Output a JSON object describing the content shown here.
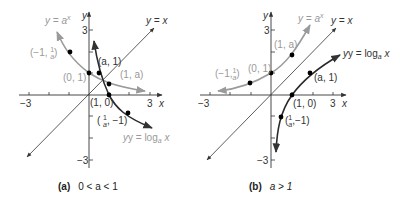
{
  "panels": [
    {
      "id": "a",
      "caption_letter": "(a)",
      "caption_condition": "0 < a < 1",
      "x_axis_label": "x",
      "y_axis_label": "y",
      "tick_labels": {
        "x_min": "−3",
        "x_max": "3",
        "y_max": "3",
        "y_min": "−3"
      },
      "curves": {
        "exp_label": "y = a",
        "exp_sup": "x",
        "identity_label": "y = x",
        "log_label": "y = log",
        "log_sub": "a",
        "log_tail": " x"
      },
      "points": {
        "p1": "(−1, ",
        "p1_frac_num": "1",
        "p1_frac_den": "a",
        "p1_close": ")",
        "p2": "(0, 1)",
        "p3": "(a, 1)",
        "p4": "(1, a)",
        "p5": "(1, 0)",
        "p6_open": "( ",
        "p6_frac_num": "1",
        "p6_frac_den": "a",
        "p6_close": ", −1)"
      }
    },
    {
      "id": "b",
      "caption_letter": "(b)",
      "caption_condition": "a > 1",
      "x_axis_label": "x",
      "y_axis_label": "y",
      "tick_labels": {
        "x_min": "−3",
        "x_max": "3",
        "y_max": "3",
        "y_min": "−3"
      },
      "curves": {
        "exp_label": "y = a",
        "exp_sup": "x",
        "identity_label": "y = x",
        "log_label": "y = log",
        "log_sub": "a",
        "log_tail": " x"
      },
      "points": {
        "p1": "(−1,",
        "p1_frac_num": "1",
        "p1_frac_den": "a",
        "p1_close": ")",
        "p2": "(0, 1)",
        "p3": "(1, a)",
        "p4": "(a, 1)",
        "p5": "(1, 0)",
        "p6_open": "(",
        "p6_frac_num": "1",
        "p6_frac_den": "a",
        "p6_close": ",−1)"
      }
    }
  ],
  "colors": {
    "axis": "#333333",
    "exp_curve": "#9a9a9a",
    "log_curve": "#2a2a2a",
    "identity": "#333333",
    "point": "#000000"
  }
}
